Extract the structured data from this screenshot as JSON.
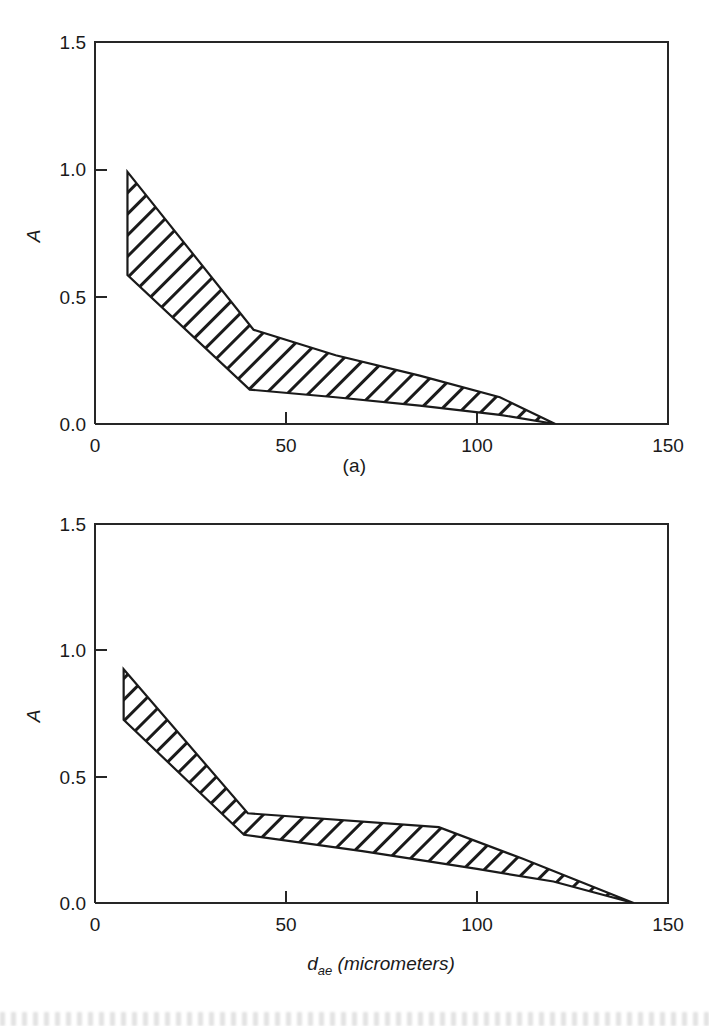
{
  "figure": {
    "background_color": "#ffffff",
    "line_color": "#1a1a1a",
    "panels": [
      {
        "key": "a",
        "caption": "(a)"
      },
      {
        "key": "b",
        "caption": "(b)"
      }
    ]
  },
  "axes": {
    "y_title": "A",
    "y_ticks": [
      "0.0",
      "0.5",
      "1.0",
      "1.5"
    ],
    "y_tick_values": [
      0.0,
      0.5,
      1.0,
      1.5
    ],
    "x_ticks": [
      "0",
      "50",
      "100",
      "150"
    ],
    "x_tick_values": [
      0,
      50,
      100,
      150
    ],
    "x_title_symbol": "d",
    "x_title_subscript": "ae",
    "x_title_unit": "(micrometers)",
    "x_title_full": "d_ae (micrometers)"
  },
  "chart_data": [
    {
      "type": "area",
      "panel": "a",
      "title": "(a)",
      "xlabel": "",
      "ylabel": "A",
      "xlim": [
        0,
        150
      ],
      "ylim": [
        0,
        1.5
      ],
      "grid": false,
      "legend": "none",
      "fill_style": "diagonal-hatch",
      "hatch_angle_deg": 45,
      "series": [
        {
          "name": "upper bound",
          "x": [
            8.5,
            41.5,
            63,
            85,
            106,
            120.5
          ],
          "values": [
            0.99,
            0.37,
            0.27,
            0.19,
            0.105,
            0.0
          ]
        },
        {
          "name": "lower bound",
          "x": [
            8.5,
            40.5,
            63,
            85,
            106,
            120.5
          ],
          "values": [
            0.585,
            0.135,
            0.105,
            0.072,
            0.036,
            0.0
          ]
        }
      ]
    },
    {
      "type": "area",
      "panel": "b",
      "title": "(b)",
      "xlabel": "d_ae (micrometers)",
      "ylabel": "A",
      "xlim": [
        0,
        150
      ],
      "ylim": [
        0,
        1.5
      ],
      "grid": false,
      "legend": "none",
      "fill_style": "diagonal-hatch",
      "hatch_angle_deg": 45,
      "series": [
        {
          "name": "upper bound",
          "x": [
            7.5,
            40,
            90,
            112,
            141
          ],
          "values": [
            0.925,
            0.355,
            0.3,
            0.175,
            0.0
          ]
        },
        {
          "name": "lower bound",
          "x": [
            7.5,
            39,
            70,
            100,
            120,
            141
          ],
          "values": [
            0.725,
            0.27,
            0.205,
            0.135,
            0.085,
            0.0
          ]
        }
      ]
    }
  ]
}
